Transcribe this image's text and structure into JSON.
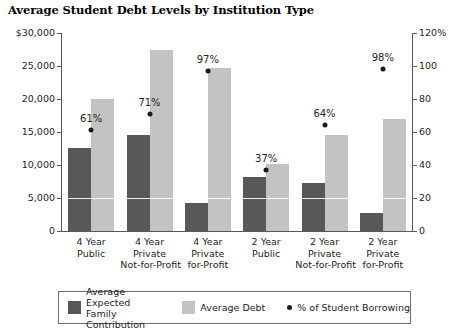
{
  "chart_data": {
    "type": "bar",
    "title": "Average Student Debt Levels by Institution Type",
    "xlabel": "",
    "ylabel": "",
    "ylim": [
      0,
      30000
    ],
    "y2lim": [
      0,
      120
    ],
    "grid": false,
    "legend_position": "bottom",
    "categories": [
      "4 Year\nPublic",
      "4 Year\nPrivate\nNot-for-Profit",
      "4 Year\nPrivate\nfor-Profit",
      "2 Year\nPublic",
      "2 Year\nPrivate\nNot-for-Profit",
      "2 Year\nPrivate\nfor-Profit"
    ],
    "series": [
      {
        "name": "Average Expected Family Contribution",
        "axis": "left",
        "color": "#58585a",
        "values": [
          12600,
          14600,
          4300,
          8200,
          7200,
          2800
        ]
      },
      {
        "name": "Average Debt",
        "axis": "left",
        "color": "#c3c3c3",
        "values": [
          20000,
          27500,
          24700,
          10200,
          14600,
          17000
        ]
      },
      {
        "name": "% of Student Borrowing",
        "axis": "right",
        "color": "#1a1a1a",
        "type": "scatter",
        "values": [
          61,
          71,
          97,
          37,
          64,
          98
        ],
        "labels": [
          "61%",
          "71%",
          "97%",
          "37%",
          "64%",
          "98%"
        ]
      }
    ],
    "yticks": [
      {
        "value": 30000,
        "label": "$30,000"
      },
      {
        "value": 25000,
        "label": "25,000"
      },
      {
        "value": 20000,
        "label": "20,000"
      },
      {
        "value": 15000,
        "label": "15,000"
      },
      {
        "value": 10000,
        "label": "10,000"
      },
      {
        "value": 5000,
        "label": "5,000"
      },
      {
        "value": 0,
        "label": "0"
      }
    ],
    "y2ticks": [
      {
        "value": 120,
        "label": "120%"
      },
      {
        "value": 100,
        "label": "100"
      },
      {
        "value": 80,
        "label": "80"
      },
      {
        "value": 60,
        "label": "60"
      },
      {
        "value": 40,
        "label": "40"
      },
      {
        "value": 20,
        "label": "20"
      },
      {
        "value": 0,
        "label": "0"
      }
    ],
    "legend": [
      {
        "label": "Average Expected\nFamily Contribution",
        "swatch": "dark"
      },
      {
        "label": "Average Debt",
        "swatch": "light"
      },
      {
        "label": "% of Student Borrowing",
        "swatch": "dot"
      }
    ]
  }
}
